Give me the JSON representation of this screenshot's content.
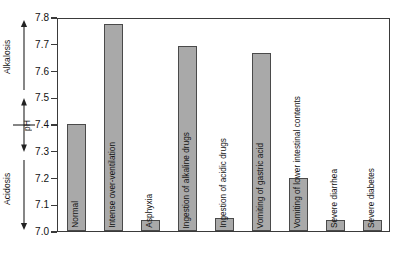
{
  "chart_data": {
    "type": "bar",
    "title": "",
    "xlabel": "",
    "ylabel": "pH",
    "ylim": [
      7.0,
      7.8
    ],
    "yticks": [
      "7.0",
      "7.1",
      "7.2",
      "7.3",
      "7.4",
      "7.5",
      "7.6",
      "7.7",
      "7.8"
    ],
    "ytick_values": [
      7.0,
      7.1,
      7.2,
      7.3,
      7.4,
      7.5,
      7.6,
      7.7,
      7.8
    ],
    "grid": false,
    "legend": "none",
    "categories": [
      "Normal",
      "Intense over-ventilation",
      "Asphyxia",
      "Ingestion of alkaline drugs",
      "Ingestion of acidic drugs",
      "Vomiting of gastric acid",
      "Vomiting of lower intestinal contents",
      "Severe diarrhea",
      "Severe diabetes"
    ],
    "values": [
      7.4,
      7.775,
      7.04,
      7.69,
      7.05,
      7.665,
      7.2,
      7.04,
      7.04
    ],
    "bar_color": "#a9a9a9",
    "bar_edge_color": "#4a4a4a",
    "frame_color": "#3a3a3a",
    "background_color": "#ffffff",
    "annotations": [
      {
        "label": "Alkalosis",
        "direction": "up",
        "at_value": 7.6
      },
      {
        "label": "pH",
        "direction": "both",
        "at_value": 7.4
      },
      {
        "label": "Acidosis",
        "direction": "down",
        "at_value": 7.2
      }
    ]
  }
}
